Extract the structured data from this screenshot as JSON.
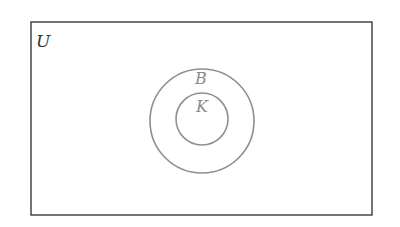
{
  "diagram": {
    "type": "venn",
    "universe": {
      "label": "U",
      "color": "#333333"
    },
    "sets": [
      {
        "label": "B",
        "color": "#8a8a8a",
        "contains": "K"
      },
      {
        "label": "K",
        "color": "#8a8a8a",
        "subset_of": "B"
      }
    ]
  }
}
